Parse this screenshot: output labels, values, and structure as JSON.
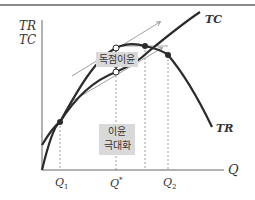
{
  "axes": {
    "y_label_1": "TR",
    "y_label_2": "TC",
    "x_label": "Q"
  },
  "curves": {
    "tc_label": "TC",
    "tr_label": "TR"
  },
  "ticks": {
    "q1": "Q",
    "q1_sub": "1",
    "qstar": "Q",
    "qstar_sup": "*",
    "q2": "Q",
    "q2_sub": "2"
  },
  "annotations": {
    "monopoly_profit": "독점이윤",
    "profit_max_line1": "이윤",
    "profit_max_line2": "극대화"
  },
  "colors": {
    "curve": "#2b2b2b",
    "axis": "#555555",
    "box": "#d9d9d9",
    "tangent": "#777777"
  }
}
